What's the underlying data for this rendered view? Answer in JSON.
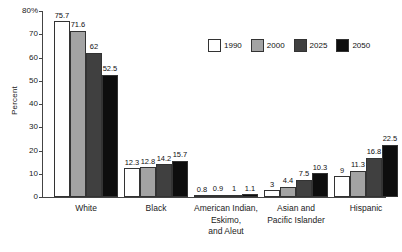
{
  "chart_data": {
    "type": "bar",
    "title": "",
    "xlabel": "",
    "ylabel": "Percent",
    "ylim": [
      0,
      80
    ],
    "ytick_labels": [
      "80%",
      "70",
      "60",
      "50",
      "40",
      "30",
      "20",
      "10",
      "0"
    ],
    "yticks": [
      80,
      70,
      60,
      50,
      40,
      30,
      20,
      10,
      0
    ],
    "grid": false,
    "legend_position": "upper-right",
    "categories": [
      "White",
      "Black",
      "American Indian, Eskimo, and Aleut",
      "Asian and Pacific Islander",
      "Hispanic"
    ],
    "category_label_lines": [
      [
        "White"
      ],
      [
        "Black"
      ],
      [
        "American Indian,",
        "Eskimo,",
        "and Aleut"
      ],
      [
        "Asian and",
        "Pacific Islander"
      ],
      [
        "Hispanic"
      ]
    ],
    "series": [
      {
        "name": "1990",
        "color": "#ffffff",
        "values": [
          75.7,
          12.3,
          0.8,
          3,
          9
        ],
        "value_labels": [
          "75.7",
          "12.3",
          "0.8",
          "3",
          "9"
        ]
      },
      {
        "name": "2000",
        "color": "#a3a3a3",
        "values": [
          71.6,
          12.8,
          0.9,
          4.4,
          11.3
        ],
        "value_labels": [
          "71.6",
          "12.8",
          "0.9",
          "4.4",
          "11.3"
        ]
      },
      {
        "name": "2025",
        "color": "#404040",
        "values": [
          62,
          14.2,
          1,
          7.5,
          16.8
        ],
        "value_labels": [
          "62",
          "14.2",
          "1",
          "7.5",
          "16.8"
        ]
      },
      {
        "name": "2050",
        "color": "#0d0d0d",
        "values": [
          52.5,
          15.7,
          1.1,
          10.3,
          22.5
        ],
        "value_labels": [
          "52.5",
          "15.7",
          "1.1",
          "10.3",
          "22.5"
        ]
      }
    ]
  },
  "legend": {
    "entries": [
      {
        "label": "1990",
        "color": "#ffffff"
      },
      {
        "label": "2000",
        "color": "#a3a3a3"
      },
      {
        "label": "2025",
        "color": "#404040"
      },
      {
        "label": "2050",
        "color": "#0d0d0d"
      }
    ]
  },
  "axes": {
    "y_title": "Percent"
  }
}
